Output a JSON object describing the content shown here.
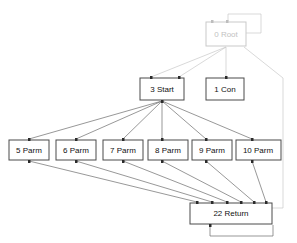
{
  "diagram": {
    "type": "node-graph",
    "title": "",
    "canvas": {
      "width": 297,
      "height": 243,
      "background": "#ffffff"
    },
    "colors": {
      "node_stroke": "#4a4a4a",
      "node_fill": "#ffffff",
      "node_stroke_dim": "#c9c9c9",
      "label": "#111111",
      "label_dim": "#c2c2c2",
      "edge": "#6b6b6b",
      "edge_dim": "#c9c9c9",
      "port": "#2b2b2b"
    },
    "nodes": [
      {
        "id": "root",
        "label": "0 Root",
        "x": 206,
        "y": 22,
        "w": 40,
        "h": 24,
        "dim": true
      },
      {
        "id": "start",
        "label": "3 Start",
        "x": 140,
        "y": 78,
        "w": 44,
        "h": 22,
        "dim": false
      },
      {
        "id": "con",
        "label": "1 Con",
        "x": 206,
        "y": 78,
        "w": 38,
        "h": 22,
        "dim": false
      },
      {
        "id": "p5",
        "label": "5 Parm",
        "x": 9,
        "y": 140,
        "w": 40,
        "h": 20,
        "dim": false
      },
      {
        "id": "p6",
        "label": "6 Parm",
        "x": 56,
        "y": 140,
        "w": 40,
        "h": 20,
        "dim": false
      },
      {
        "id": "p7",
        "label": "7 Parm",
        "x": 103,
        "y": 140,
        "w": 40,
        "h": 20,
        "dim": false
      },
      {
        "id": "p8",
        "label": "8 Parm",
        "x": 148,
        "y": 140,
        "w": 40,
        "h": 20,
        "dim": false
      },
      {
        "id": "p9",
        "label": "9 Parm",
        "x": 192,
        "y": 140,
        "w": 40,
        "h": 20,
        "dim": false
      },
      {
        "id": "p10",
        "label": "10 Parm",
        "x": 236,
        "y": 140,
        "w": 45,
        "h": 20,
        "dim": false
      },
      {
        "id": "ret",
        "label": "22 Return",
        "x": 190,
        "y": 203,
        "w": 82,
        "h": 21,
        "dim": false
      }
    ],
    "edges": [
      {
        "from": "root",
        "to": "root",
        "kind": "self-loop"
      },
      {
        "from": "root",
        "to": "start",
        "kind": "tree"
      },
      {
        "from": "root",
        "to": "start",
        "kind": "tree"
      },
      {
        "from": "root",
        "to": "con",
        "kind": "tree"
      },
      {
        "from": "root",
        "to": "ret",
        "kind": "long-right"
      },
      {
        "from": "start",
        "to": "p5",
        "kind": "tree"
      },
      {
        "from": "start",
        "to": "p6",
        "kind": "tree"
      },
      {
        "from": "start",
        "to": "p7",
        "kind": "tree"
      },
      {
        "from": "start",
        "to": "p8",
        "kind": "tree"
      },
      {
        "from": "start",
        "to": "p9",
        "kind": "tree"
      },
      {
        "from": "start",
        "to": "p10",
        "kind": "tree"
      },
      {
        "from": "p5",
        "to": "ret",
        "kind": "tree"
      },
      {
        "from": "p6",
        "to": "ret",
        "kind": "tree"
      },
      {
        "from": "p7",
        "to": "ret",
        "kind": "tree"
      },
      {
        "from": "p8",
        "to": "ret",
        "kind": "tree"
      },
      {
        "from": "p9",
        "to": "ret",
        "kind": "tree"
      },
      {
        "from": "p10",
        "to": "ret",
        "kind": "tree"
      },
      {
        "from": "ret",
        "to": "ret",
        "kind": "self-loop"
      }
    ]
  }
}
